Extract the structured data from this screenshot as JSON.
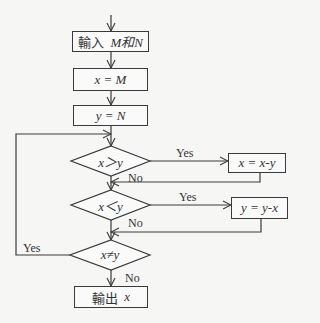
{
  "flowchart": {
    "nodes": {
      "input": {
        "prefix": "輸入",
        "expr": "M和N"
      },
      "assign_x": {
        "text": "x = M"
      },
      "assign_y": {
        "text": "y = N"
      },
      "cond1": {
        "text": "x＞y"
      },
      "sub_x": {
        "text": "x = x-y"
      },
      "cond2": {
        "text": "x＜y"
      },
      "sub_y": {
        "text": "y = y-x"
      },
      "cond3": {
        "text": "x≠y"
      },
      "output": {
        "prefix": "輸出",
        "expr": "x"
      }
    },
    "labels": {
      "yes1": "Yes",
      "no1": "No",
      "yes2": "Yes",
      "no2": "No",
      "yes3": "Yes",
      "no3": "No"
    }
  }
}
